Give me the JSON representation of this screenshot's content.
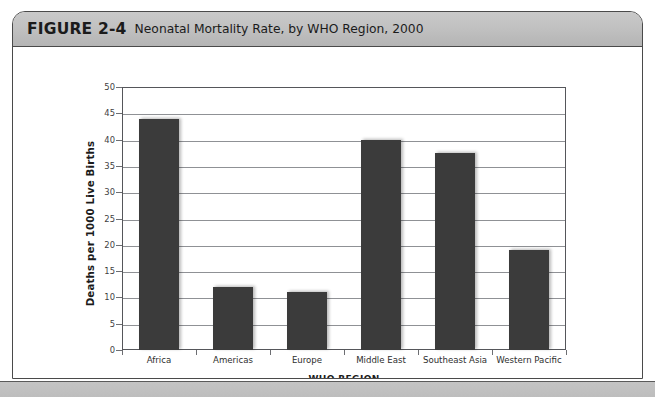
{
  "figure": {
    "number": "FIGURE 2-4",
    "caption": "Neonatal Mortality Rate, by WHO Region, 2000"
  },
  "colors": {
    "bar": "#3b3b3b",
    "header_band": "#c2c2c2",
    "frame_border": "#4a4a4a",
    "gridline": "#8f9195",
    "plot_background": "#ffffff"
  },
  "chart_data": {
    "type": "bar",
    "title": "Neonatal Mortality Rate, by WHO Region, 2000",
    "xlabel": "WHO REGION",
    "ylabel": "Deaths per 1000 Live Births",
    "categories": [
      "Africa",
      "Americas",
      "Europe",
      "Middle East",
      "Southeast Asia",
      "Western Pacific"
    ],
    "values": [
      44,
      12,
      11,
      40,
      37.5,
      19
    ],
    "ylim": [
      0,
      50
    ],
    "ytick_step": 5,
    "yticks": [
      50,
      45,
      40,
      35,
      30,
      25,
      20,
      15,
      10,
      5,
      0
    ],
    "grid": true,
    "legend": "none"
  }
}
